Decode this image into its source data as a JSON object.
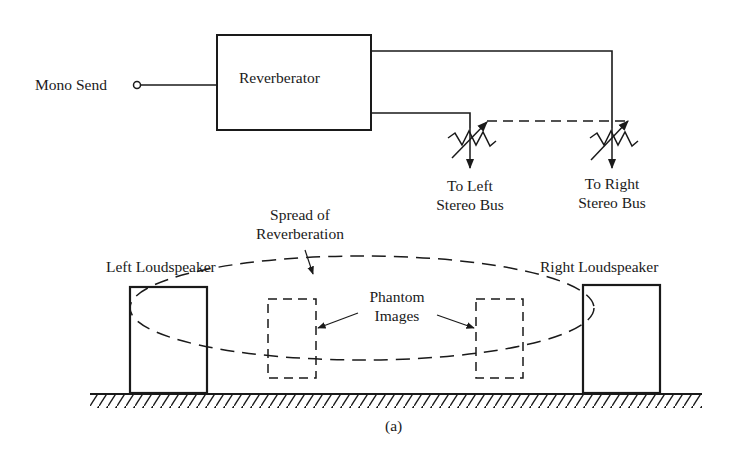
{
  "diagram": {
    "caption": "(a)",
    "input": {
      "label": "Mono Send"
    },
    "processor": {
      "label": "Reverberator"
    },
    "outputs": [
      {
        "line1": "To Left",
        "line2": "Stereo Bus"
      },
      {
        "line1": "To Right",
        "line2": "Stereo Bus"
      }
    ],
    "annotations": {
      "spread_line1": "Spread of",
      "spread_line2": "Reverberation",
      "phantom_line1": "Phantom",
      "phantom_line2": "Images"
    },
    "speakers": {
      "left": "Left Loudspeaker",
      "right": "Right Loudspeaker"
    },
    "colors": {
      "ink": "#1a1a1a",
      "background": "#ffffff"
    }
  }
}
